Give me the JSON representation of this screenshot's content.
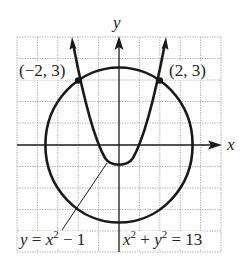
{
  "diagram": {
    "type": "graph-system-of-equations",
    "axes": {
      "x_label": "x",
      "y_label": "y",
      "x_range": [
        -5,
        5
      ],
      "y_range": [
        -5,
        5
      ],
      "grid": true
    },
    "curves": [
      {
        "name": "parabola",
        "equation_lhs": "y",
        "equation_rhs_base": "x",
        "equation_rhs_exp": "2",
        "equation_rhs_tail": "− 1",
        "full": "y = x^2 − 1"
      },
      {
        "name": "circle",
        "full": "x^2 + y^2 = 13",
        "term1_base": "x",
        "term1_exp": "2",
        "plus": "+",
        "term2_base": "y",
        "term2_exp": "2",
        "equals": "=",
        "value": "13"
      }
    ],
    "points": [
      {
        "label": "(−2, 3)",
        "x": -2,
        "y": 3
      },
      {
        "label": "(2, 3)",
        "x": 2,
        "y": 3
      }
    ],
    "colors": {
      "curve": "#1a1a1a",
      "grid": "#b5b5b5",
      "background": "#ffffff"
    }
  }
}
